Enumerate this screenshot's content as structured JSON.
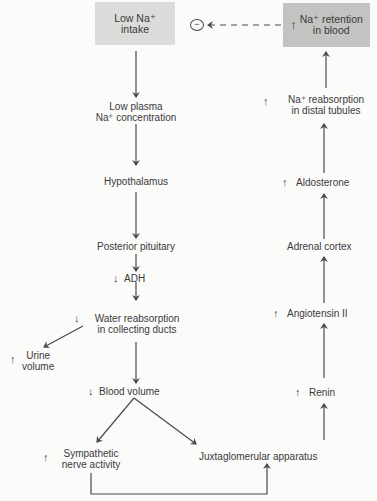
{
  "diagram": {
    "boxes": {
      "low_na_intake": {
        "line1": "Low Na⁺",
        "line2": "intake"
      },
      "na_retention": {
        "indicator": "↑",
        "line1": "Na⁺ retention",
        "line2": "in blood"
      }
    },
    "feedback_symbol": "−",
    "left_chain": [
      {
        "id": "low_plasma_na",
        "line1": "Low plasma",
        "line2": "Na⁺ concentration",
        "indicator": ""
      },
      {
        "id": "hypothalamus",
        "line1": "Hypothalamus",
        "indicator": ""
      },
      {
        "id": "posterior_pituitary",
        "line1": "Posterior pituitary",
        "indicator": ""
      },
      {
        "id": "adh",
        "line1": "ADH",
        "indicator": "↓"
      },
      {
        "id": "water_reabsorption",
        "line1": "Water reabsorption",
        "line2": "in collecting ducts",
        "indicator": "↓"
      },
      {
        "id": "urine_volume",
        "line1": "Urine",
        "line2": "volume",
        "indicator": "↑"
      },
      {
        "id": "blood_volume",
        "line1": "Blood volume",
        "indicator": "↓"
      },
      {
        "id": "sympathetic",
        "line1": "Sympathetic",
        "line2": "nerve activity",
        "indicator": "↑"
      },
      {
        "id": "jga",
        "line1": "Juxtaglomerular apparatus",
        "indicator": ""
      }
    ],
    "right_chain": [
      {
        "id": "renin",
        "line1": "Renin",
        "indicator": "↑"
      },
      {
        "id": "angiotensin",
        "line1": "Angiotensin II",
        "indicator": "↑"
      },
      {
        "id": "adrenal_cortex",
        "line1": "Adrenal cortex",
        "indicator": ""
      },
      {
        "id": "aldosterone",
        "line1": "Aldosterone",
        "indicator": "↑"
      },
      {
        "id": "na_reabsorption",
        "line1": "Na⁺ reabsorption",
        "line2": "in distal tubules",
        "indicator": "↑"
      }
    ],
    "colors": {
      "line": "#4a4a4a",
      "box_light": "#dcdcdb",
      "box_dark": "#c3c3c2",
      "text": "#3a3a3a"
    }
  }
}
